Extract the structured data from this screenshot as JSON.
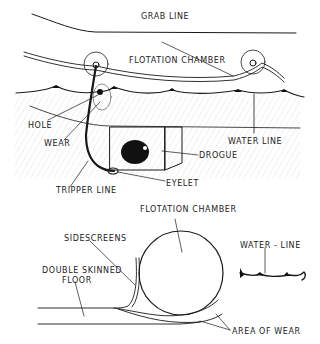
{
  "top_diagram": {
    "labels": {
      "grab_line": "GRAB LINE",
      "flotation_chamber": "FLOTATION CHAMBER",
      "hole": "HOLE",
      "wear": "WEAR",
      "water_line": "WATER LINE",
      "drogue": "DROGUE",
      "tripper_line": "TRIPPER LINE",
      "eyelet": "EYELET"
    }
  },
  "bottom_diagram": {
    "labels": {
      "flotation_chamber": "FLOTATION CHAMBER",
      "sidescreens": "SIDESCREENS",
      "water_line": "WATER - LINE",
      "double_skinned_floor_1": "DOUBLE SKINNED",
      "double_skinned_floor_2": "FLOOR",
      "area_of_wear": "AREA OF WEAR"
    }
  }
}
